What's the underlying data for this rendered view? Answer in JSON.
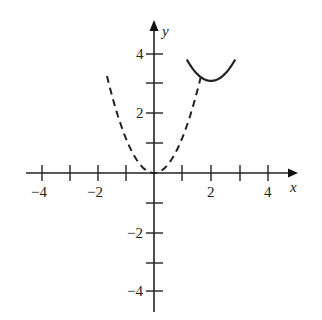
{
  "chart_data": {
    "type": "line",
    "title": "",
    "xlabel": "x",
    "ylabel": "y",
    "xlim": [
      -4.3,
      5
    ],
    "ylim": [
      -4.7,
      5.1
    ],
    "grid": false,
    "legend": null,
    "x_ticks": [
      -4,
      -3,
      -2,
      -1,
      1,
      2,
      3,
      4
    ],
    "x_tick_labels": [
      "-4",
      "-2",
      "2",
      "4"
    ],
    "y_ticks": [
      -4,
      -3,
      -2,
      -1,
      1,
      2,
      3,
      4
    ],
    "y_tick_labels": [
      "4",
      "2",
      "-2",
      "-4"
    ],
    "series": [
      {
        "name": "dashed parabola",
        "style": "dashed",
        "equation": "y = 1.2x^2",
        "x": [
          -1.65,
          -1.2,
          -0.8,
          -0.4,
          0,
          0.4,
          0.8,
          1.2,
          1.65
        ],
        "y": [
          3.3,
          1.73,
          0.77,
          0.19,
          0,
          0.19,
          0.77,
          1.73,
          3.3
        ]
      },
      {
        "name": "solid parabola",
        "style": "solid",
        "equation": "y = (x-2)^2 + 3.1",
        "x": [
          1.15,
          1.5,
          2.0,
          2.5,
          2.85
        ],
        "y": [
          3.82,
          3.35,
          3.1,
          3.35,
          3.82
        ]
      }
    ]
  },
  "labels": {
    "x_axis": "x",
    "y_axis": "y",
    "tick_neg4": "−4",
    "tick_neg2": "−2",
    "tick_2": "2",
    "tick_4": "4",
    "ytick_4": "4",
    "ytick_2": "2",
    "ytick_neg2": "−2",
    "ytick_neg4": "−4"
  }
}
